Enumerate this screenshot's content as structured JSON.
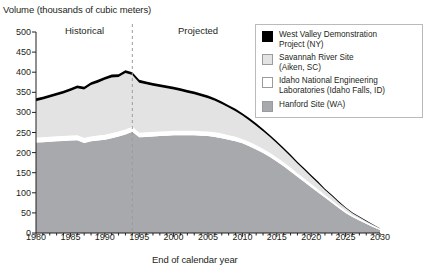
{
  "chart_data": {
    "type": "area",
    "stacked": true,
    "title": "",
    "ylabel": "Volume (thousands of cubic meters)",
    "xlabel": "End of calendar year",
    "ylim": [
      0,
      500
    ],
    "ytick_step": 50,
    "yticks": [
      0,
      50,
      100,
      150,
      200,
      250,
      300,
      350,
      400,
      450,
      500
    ],
    "xlim": [
      1980,
      2030
    ],
    "xticks": [
      1980,
      1985,
      1990,
      1995,
      2000,
      2005,
      2010,
      2015,
      2020,
      2025,
      2030
    ],
    "xtick_minor_step": 1,
    "grid": false,
    "legend_position": "top-right",
    "divider": {
      "x": 1994,
      "style": "dashed",
      "color": "#9a9b9d"
    },
    "annotations": [
      {
        "text": "Historical",
        "x": 1985
      },
      {
        "text": "Projected",
        "x": 2003
      }
    ],
    "x": [
      1980,
      1981,
      1982,
      1983,
      1984,
      1985,
      1986,
      1987,
      1988,
      1989,
      1990,
      1991,
      1992,
      1993,
      1994,
      1995,
      1996,
      1997,
      1998,
      1999,
      2000,
      2001,
      2002,
      2003,
      2004,
      2005,
      2006,
      2007,
      2008,
      2009,
      2010,
      2011,
      2012,
      2013,
      2014,
      2015,
      2016,
      2017,
      2018,
      2019,
      2020,
      2021,
      2022,
      2023,
      2024,
      2025,
      2026,
      2027,
      2028,
      2029,
      2030
    ],
    "series": [
      {
        "name": "Hanford Site (WA)",
        "color": "#a7a9ac",
        "values": [
          225,
          226,
          227,
          228,
          229,
          230,
          231,
          224,
          228,
          230,
          232,
          236,
          240,
          245,
          252,
          238,
          239,
          240,
          241,
          242,
          243,
          243,
          243,
          243,
          242,
          241,
          239,
          236,
          232,
          228,
          223,
          216,
          208,
          199,
          189,
          178,
          166,
          153,
          140,
          127,
          114,
          101,
          88,
          75,
          62,
          50,
          40,
          31,
          23,
          15,
          8
        ]
      },
      {
        "name": "Idaho National Engineering Laboratories (Idaho Falls, ID)",
        "color": "#ffffff",
        "values": [
          11,
          11,
          11,
          11,
          11,
          11,
          11,
          11,
          11,
          11,
          11,
          11,
          11,
          11,
          11,
          10,
          10,
          10,
          10,
          10,
          10,
          10,
          10,
          10,
          10,
          10,
          10,
          10,
          10,
          10,
          9,
          9,
          9,
          9,
          9,
          8,
          8,
          8,
          7,
          7,
          6,
          6,
          5,
          5,
          4,
          4,
          3,
          3,
          2,
          2,
          1
        ]
      },
      {
        "name": "Savannah River Site (Aiken, SC)",
        "color": "#e3e3e4",
        "values": [
          92,
          95,
          99,
          103,
          107,
          112,
          118,
          122,
          129,
          133,
          138,
          140,
          137,
          142,
          130,
          126,
          121,
          116,
          112,
          108,
          104,
          100,
          96,
          92,
          88,
          84,
          80,
          75,
          70,
          65,
          60,
          55,
          50,
          45,
          41,
          37,
          33,
          29,
          26,
          23,
          20,
          17,
          14,
          12,
          10,
          8,
          6,
          5,
          4,
          3,
          2
        ]
      },
      {
        "name": "West Valley Demonstration Project (NY)",
        "color": "#000000",
        "values": [
          7,
          7,
          7,
          7,
          7,
          7,
          7,
          7,
          7,
          7,
          7,
          7,
          7,
          7,
          7,
          7,
          7,
          7,
          7,
          7,
          7,
          7,
          7,
          7,
          7,
          7,
          6,
          6,
          6,
          6,
          6,
          6,
          6,
          6,
          5,
          5,
          5,
          5,
          4,
          4,
          4,
          4,
          3,
          3,
          3,
          2,
          2,
          2,
          2,
          1,
          1
        ]
      }
    ],
    "totals": [
      335,
      339,
      344,
      349,
      354,
      360,
      367,
      364,
      375,
      381,
      388,
      394,
      395,
      405,
      400,
      381,
      377,
      373,
      370,
      367,
      364,
      360,
      356,
      352,
      347,
      342,
      335,
      327,
      318,
      309,
      298,
      286,
      273,
      259,
      244,
      228,
      212,
      195,
      177,
      161,
      144,
      128,
      110,
      95,
      79,
      64,
      51,
      41,
      31,
      21,
      12
    ]
  },
  "legend": {
    "items": [
      {
        "label_line1": "West Valley Demonstration",
        "label_line2": "Project (NY)",
        "color": "#000000",
        "name": "west-valley"
      },
      {
        "label_line1": "Savannah River Site",
        "label_line2": "(Aiken, SC)",
        "color": "#e3e3e4",
        "name": "savannah-river"
      },
      {
        "label_line1": "Idaho National Engineering",
        "label_line2": "Laboratories (Idaho Falls, ID)",
        "color": "#ffffff",
        "name": "idaho-national"
      },
      {
        "label_line1": "Hanford Site (WA)",
        "label_line2": "",
        "color": "#a7a9ac",
        "name": "hanford"
      }
    ]
  }
}
